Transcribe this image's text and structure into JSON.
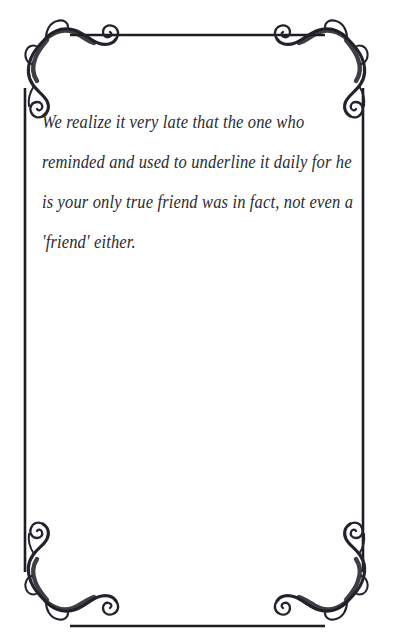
{
  "page": {
    "background_color": "#ffffff",
    "width": 393,
    "height": 640
  },
  "header": {
    "cut_off_text": "­ ­ ­ ­ ­ ­ ­ ­ ­ ­",
    "color": "#ededf0"
  },
  "frame": {
    "line_color": "#1d1d22",
    "ornament_color": "#23232b",
    "top_rule_y": 35,
    "bottom_rule_y": 626,
    "left_rule_x": 25,
    "right_rule_x": 363,
    "corner_ornaments": [
      "top-left-flourish",
      "top-right-flourish",
      "bottom-left-flourish",
      "bottom-right-flourish"
    ]
  },
  "quote": {
    "ink_color": "#2b2b33",
    "lines": [
      "We realize it very late that the one who",
      "reminded and used to underline it daily for he",
      "is your only true friend was in fact, not even a",
      "'friend' either."
    ],
    "full_text": "We realize it very late that the one who reminded and used to underline it daily for he is your only true friend was in fact, not even a 'friend' either."
  }
}
